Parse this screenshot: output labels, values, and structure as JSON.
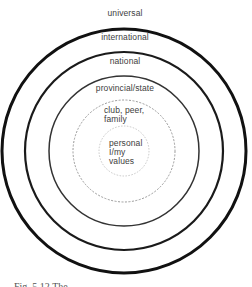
{
  "diagram": {
    "type": "concentric-circles",
    "center": {
      "x": 124,
      "y": 151
    },
    "rings": [
      {
        "id": "universal",
        "label": "universal",
        "radius": 122,
        "stroke": "#111111",
        "stroke_width": 3.0,
        "dash": ""
      },
      {
        "id": "international",
        "label": "international",
        "radius": 99,
        "stroke": "#1a1a1a",
        "stroke_width": 2.2,
        "dash": ""
      },
      {
        "id": "national",
        "label": "national",
        "radius": 75,
        "stroke": "#333333",
        "stroke_width": 1.5,
        "dash": ""
      },
      {
        "id": "provincial",
        "label": "provincial/state",
        "radius": 51,
        "stroke": "#9a9a9a",
        "stroke_width": 1.0,
        "dash": "2 1.5"
      },
      {
        "id": "personal",
        "label": "personal I/my values",
        "radius": 25,
        "stroke": "#c8c8c8",
        "stroke_width": 1.0,
        "dash": "1.5 1.5"
      }
    ],
    "labels": {
      "universal": "universal",
      "international": "international",
      "national": "national",
      "provincial": "provincial/state",
      "club_line1": "club, peer,",
      "club_line2": "family",
      "personal_line1": "personal",
      "personal_line2": "I/my",
      "personal_line3": "values"
    }
  },
  "caption": {
    "text": "Fig. 5.12   The ..."
  }
}
